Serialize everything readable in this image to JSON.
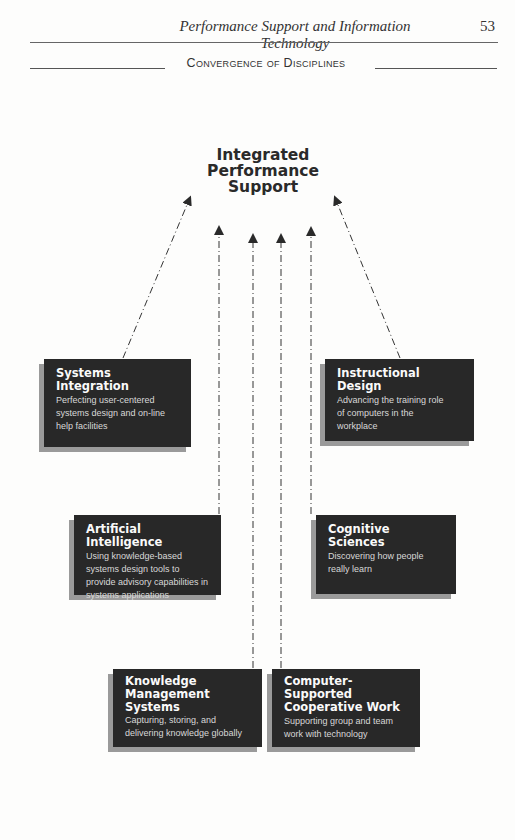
{
  "running_head": {
    "title": "Performance Support and Information Technology",
    "page_number": "53"
  },
  "section": {
    "title": "Convergence of Disciplines"
  },
  "diagram": {
    "center": {
      "line1": "Integrated",
      "line2": "Performance",
      "line3": "Support"
    },
    "boxes": [
      {
        "id": "systems-integration",
        "title": "Systems Integration",
        "title_lines": [
          "Systems",
          "Integration"
        ],
        "description": "Perfecting user-centered systems design and on-line help facilities"
      },
      {
        "id": "instructional-design",
        "title": "Instructional Design",
        "title_lines": [
          "Instructional",
          "Design"
        ],
        "description": "Advancing the training role of computers in the workplace"
      },
      {
        "id": "artificial-intelligence",
        "title": "Artificial Intelligence",
        "title_lines": [
          "Artificial Intelligence"
        ],
        "description": "Using knowledge-based systems design tools to provide advisory capabilities in systems applications"
      },
      {
        "id": "cognitive-sciences",
        "title": "Cognitive Sciences",
        "title_lines": [
          "Cognitive",
          "Sciences"
        ],
        "description": "Discovering how people really learn"
      },
      {
        "id": "knowledge-management-systems",
        "title": "Knowledge Management Systems",
        "title_lines": [
          "Knowledge",
          "Management",
          "Systems"
        ],
        "description": "Capturing, storing, and delivering knowledge globally"
      },
      {
        "id": "cscw",
        "title": "Computer-Supported Cooperative Work",
        "title_lines": [
          "Computer-Supported",
          "Cooperative Work"
        ],
        "description": "Supporting group and team work with technology"
      }
    ],
    "connections": [
      {
        "from": "systems-integration",
        "to": "center",
        "style": "dash-dot"
      },
      {
        "from": "instructional-design",
        "to": "center",
        "style": "dash-dot"
      },
      {
        "from": "artificial-intelligence",
        "to": "center",
        "style": "dash-dot"
      },
      {
        "from": "cognitive-sciences",
        "to": "center",
        "style": "dash-dot"
      },
      {
        "from": "knowledge-management-systems",
        "to": "center",
        "style": "dash-dot"
      },
      {
        "from": "cscw",
        "to": "center",
        "style": "dash-dot"
      }
    ],
    "colors": {
      "box_fill": "#282828",
      "box_shadow": "#9a9a9a",
      "box_text": "#eeeeee",
      "line": "#333333"
    }
  }
}
